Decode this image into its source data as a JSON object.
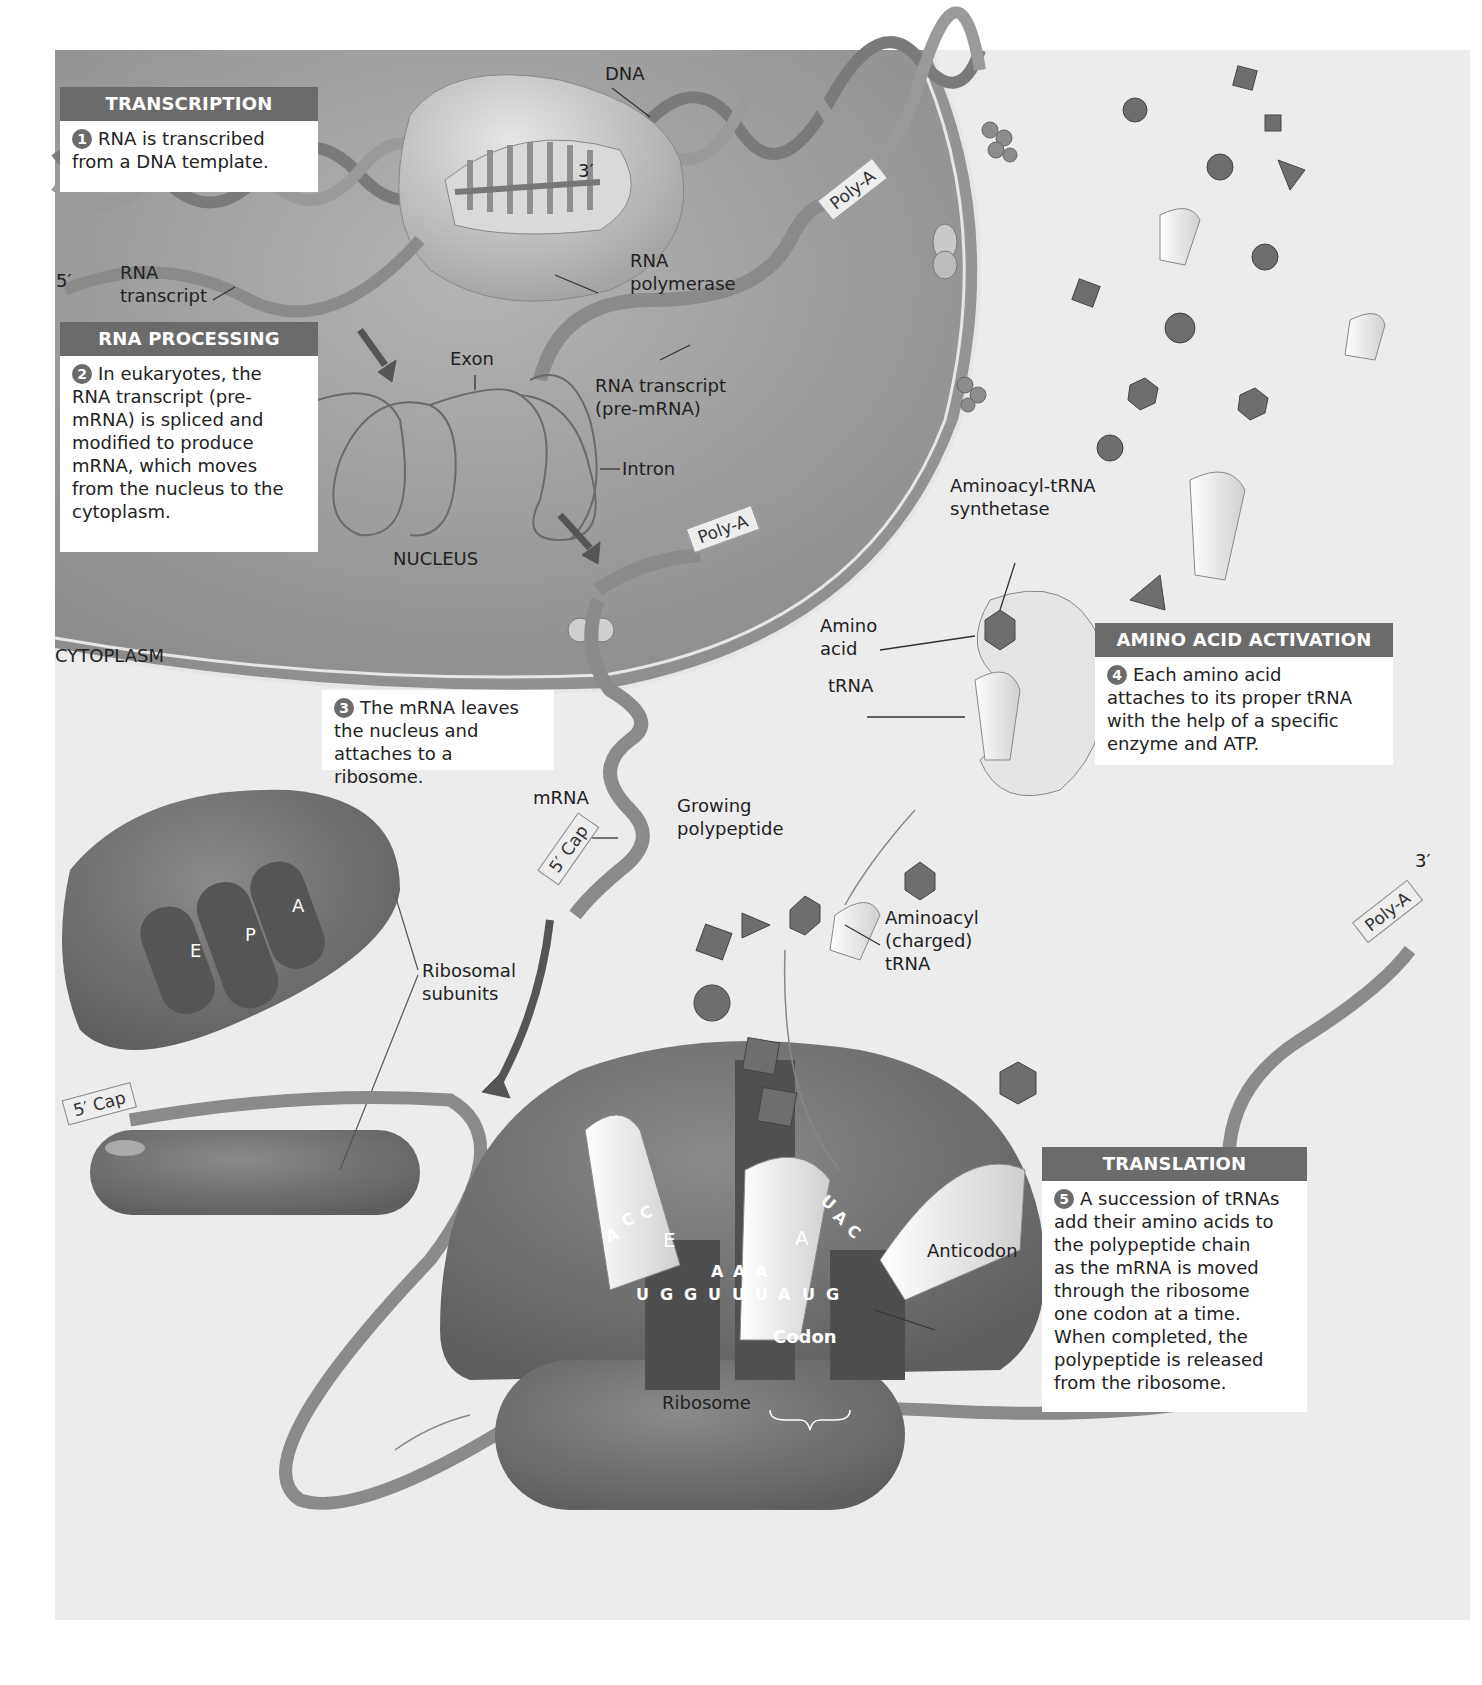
{
  "figure": {
    "regions": {
      "nucleus": "NUCLEUS",
      "cytoplasm": "CYTOPLASM"
    },
    "steps": [
      {
        "id": 1,
        "title": "TRANSCRIPTION",
        "number": "1",
        "text": "RNA is transcribed from a DNA template."
      },
      {
        "id": 2,
        "title": "RNA PROCESSING",
        "number": "2",
        "text": "In eukaryotes, the RNA transcript (pre-mRNA) is spliced and modified to produce mRNA, which moves from the nucleus to the cytoplasm."
      },
      {
        "id": 3,
        "title": "",
        "number": "3",
        "text": "The mRNA leaves the nucleus and attaches to a ribosome."
      },
      {
        "id": 4,
        "title": "AMINO ACID ACTIVATION",
        "number": "4",
        "text": "Each amino acid attaches to its proper tRNA with the help of a specific enzyme and ATP."
      },
      {
        "id": 5,
        "title": "TRANSLATION",
        "number": "5",
        "text": "A succession of tRNAs add their amino acids to the polypeptide chain as the mRNA is moved through the ribosome one codon at a time. When completed, the polypeptide is released from the ribosome."
      }
    ],
    "step_lines": {
      "s1": [
        "RNA is transcribed",
        "from a DNA template."
      ],
      "s2": [
        "In eukaryotes, the",
        "RNA transcript (pre-",
        "mRNA) is spliced and",
        "modified to produce",
        "mRNA, which moves",
        "from the nucleus to the",
        "cytoplasm."
      ],
      "s3": [
        "The mRNA leaves",
        "the nucleus and",
        "attaches to a ribosome."
      ],
      "s4": [
        "Each amino acid",
        "attaches to its proper tRNA",
        "with the help of a specific",
        "enzyme and ATP."
      ],
      "s5": [
        "A succession of tRNAs",
        "add their amino acids to",
        "the polypeptide chain",
        "as the mRNA is moved",
        "through the ribosome",
        "one codon at a time.",
        "When completed, the",
        "polypeptide is released",
        "from the ribosome."
      ]
    },
    "labels": {
      "dna": "DNA",
      "three_prime_top": "3′",
      "five_prime": "5′",
      "rna_transcript_1": "RNA",
      "rna_transcript_2": "transcript",
      "rna_polymerase_1": "RNA",
      "rna_polymerase_2": "polymerase",
      "poly_a_1": "Poly-A",
      "poly_a_2": "Poly-A",
      "poly_a_3": "Poly-A",
      "exon": "Exon",
      "intron": "Intron",
      "pre_mrna_1": "RNA transcript",
      "pre_mrna_2": "(pre-mRNA)",
      "synthetase_1": "Aminoacyl-tRNA",
      "synthetase_2": "synthetase",
      "amino_acid_1": "Amino",
      "amino_acid_2": "acid",
      "trna": "tRNA",
      "mrna": "mRNA",
      "five_cap_1": "5′ Cap",
      "five_cap_2": "5′ Cap",
      "growing_1": "Growing",
      "growing_2": "polypeptide",
      "aminoacyl_1": "Aminoacyl",
      "aminoacyl_2": "(charged)",
      "aminoacyl_3": "tRNA",
      "ribosomal_1": "Ribosomal",
      "ribosomal_2": "subunits",
      "site_e": "E",
      "site_p": "P",
      "site_a": "A",
      "ribo_e": "E",
      "ribo_a": "A",
      "anticodon": "Anticodon",
      "codon": "Codon",
      "ribosome": "Ribosome",
      "three_prime_right": "3′"
    },
    "sequences": {
      "exit_anticodon": [
        "A",
        "C",
        "C"
      ],
      "p_anticodon": [
        "A",
        "A",
        "A"
      ],
      "a_anticodon": [
        "U",
        "A",
        "C"
      ],
      "mrna_bases": [
        "U",
        "G",
        "G",
        "U",
        "U",
        "U",
        "A",
        "U",
        "G"
      ]
    },
    "colors": {
      "panel_bg": "#ececec",
      "nucleus_fill": "#a9a9a9",
      "box_header": "#6b6b6b",
      "box_body": "#ffffff",
      "ribosome": "#7a7a7a",
      "trna": "#f0f0f0",
      "amino_acid": "#6e6e6e"
    }
  }
}
